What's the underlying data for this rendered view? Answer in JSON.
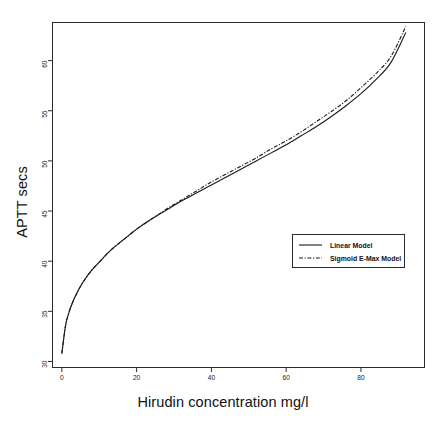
{
  "chart_data": {
    "type": "line",
    "title": "",
    "xlabel": "Hirudin concentration mg/l",
    "ylabel": "APTT secs",
    "xlim": [
      -2.5,
      97.0
    ],
    "ylim": [
      29.4,
      63.8
    ],
    "xticks": [
      0,
      20,
      40,
      60,
      80
    ],
    "xtick_labels": [
      "0",
      "20",
      "40",
      "60",
      "80"
    ],
    "yticks": [
      30,
      35,
      40,
      45,
      50,
      55,
      60
    ],
    "ytick_labels": [
      "30",
      "35",
      "40",
      "45",
      "50",
      "55",
      "60"
    ],
    "grid": false,
    "legend_position": "center-right",
    "series": [
      {
        "name": "Linear Model",
        "style": "solid",
        "color": "#1a1a1a",
        "x": [
          0,
          1,
          2,
          3,
          4,
          5,
          6,
          8,
          10,
          12,
          14,
          16,
          18,
          20,
          24,
          28,
          32,
          36,
          40,
          44,
          48,
          52,
          56,
          60,
          64,
          68,
          72,
          76,
          80,
          84,
          88,
          92
        ],
        "y": [
          30.8,
          33.6,
          35.0,
          36.0,
          36.8,
          37.5,
          38.1,
          39.1,
          39.9,
          40.7,
          41.4,
          42.0,
          42.6,
          43.2,
          44.2,
          45.1,
          46.0,
          46.8,
          47.6,
          48.4,
          49.2,
          50.0,
          50.8,
          51.6,
          52.5,
          53.4,
          54.4,
          55.5,
          56.7,
          58.1,
          59.8,
          62.8
        ]
      },
      {
        "name": "Sigmoid E-Max Model",
        "style": "dashed",
        "color": "#1a1a1a",
        "x": [
          0,
          1,
          2,
          3,
          4,
          5,
          6,
          8,
          10,
          12,
          14,
          16,
          18,
          20,
          24,
          28,
          32,
          36,
          40,
          44,
          48,
          52,
          56,
          60,
          64,
          68,
          72,
          76,
          80,
          84,
          88,
          92
        ],
        "y": [
          30.8,
          33.6,
          35.0,
          36.0,
          36.8,
          37.5,
          38.1,
          39.1,
          39.9,
          40.7,
          41.4,
          42.0,
          42.6,
          43.2,
          44.2,
          45.2,
          46.1,
          47.0,
          47.9,
          48.7,
          49.5,
          50.3,
          51.2,
          52.0,
          52.9,
          53.9,
          54.9,
          56.0,
          57.3,
          58.7,
          60.4,
          63.4
        ]
      }
    ]
  },
  "legend": {
    "entries": [
      {
        "label": "Linear Model",
        "style": "solid"
      },
      {
        "label": "Sigmoid E-Max Model",
        "style": "dashed"
      }
    ]
  }
}
